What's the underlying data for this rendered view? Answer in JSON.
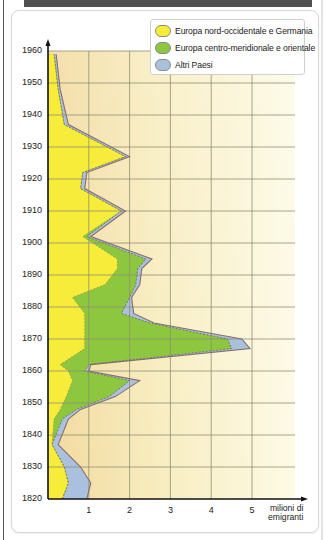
{
  "chart_data": {
    "type": "area",
    "orientation": "horizontal-stacked (years on vertical axis, values on horizontal axis)",
    "title": "",
    "xlabel": "milioni di emigranti",
    "ylabel": "",
    "xlim": [
      0,
      5.5
    ],
    "ylim": [
      1820,
      1960
    ],
    "x_ticks": [
      "1",
      "2",
      "3",
      "4",
      "5"
    ],
    "y_ticks": [
      "1960",
      "1950",
      "1940",
      "1930",
      "1920",
      "1910",
      "1900",
      "1890",
      "1880",
      "1870",
      "1860",
      "1850",
      "1840",
      "1830",
      "1820"
    ],
    "grid": true,
    "legend_position": "top-right",
    "years": [
      1820,
      1825,
      1830,
      1837,
      1845,
      1848,
      1852,
      1857,
      1860,
      1862,
      1867,
      1870,
      1875,
      1878,
      1883,
      1887,
      1892,
      1895,
      1902,
      1910,
      1917,
      1922,
      1927,
      1937,
      1948,
      1959
    ],
    "series": [
      {
        "name": "Europa nord-occidentale e Germania",
        "color": "#f7ec3a",
        "values": [
          0.35,
          0.5,
          0.4,
          0.1,
          0.15,
          0.3,
          0.45,
          0.6,
          0.5,
          0.3,
          0.9,
          0.9,
          0.9,
          0.9,
          0.6,
          1.4,
          1.7,
          1.7,
          0.85,
          1.8,
          0.8,
          0.85,
          1.9,
          0.4,
          0.25,
          0.15
        ]
      },
      {
        "name": "Europa centro-meridionale e orientale",
        "color": "#8dc63f",
        "values": [
          0.0,
          0.0,
          0.0,
          0.0,
          0.2,
          0.4,
          1.05,
          1.4,
          0.4,
          0.7,
          3.6,
          3.5,
          1.6,
          0.9,
          1.4,
          0.75,
          0.5,
          0.7,
          0.1,
          0.0,
          0.0,
          0.0,
          0.0,
          0.0,
          0.0,
          0.0
        ]
      },
      {
        "name": "Altri Paesi",
        "color": "#a9c0de",
        "values": [
          0.6,
          0.55,
          0.4,
          0.15,
          0.15,
          0.1,
          0.15,
          0.25,
          0.1,
          0.05,
          0.45,
          0.35,
          0.1,
          0.3,
          0.05,
          0.1,
          0.1,
          0.15,
          0.1,
          0.1,
          0.1,
          0.1,
          0.1,
          0.1,
          0.05,
          0.05
        ]
      }
    ]
  },
  "legend": {
    "items": [
      {
        "label": "Europa nord-occidentale e Germania",
        "color": "#f7ec3a"
      },
      {
        "label": "Europa centro-meridionale e orientale",
        "color": "#8dc63f"
      },
      {
        "label": "Altri Paesi",
        "color": "#a9c0de"
      }
    ]
  },
  "axes": {
    "x_unit_line1": "milioni di",
    "x_unit_line2": "emigranti"
  },
  "colors": {
    "header_bar": "#505050",
    "grid": "#9a9a7a",
    "background_warm": "#f0d99a",
    "background_light": "#fcf9e0"
  }
}
